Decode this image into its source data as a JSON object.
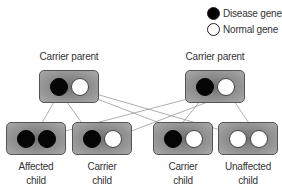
{
  "legend": {
    "disease": "Disease gene",
    "normal": "Normal gene"
  },
  "parents": [
    {
      "label": "Carrier parent",
      "alleles": [
        "disease",
        "normal"
      ]
    },
    {
      "label": "Carrier parent",
      "alleles": [
        "disease",
        "normal"
      ]
    }
  ],
  "children": [
    {
      "line1": "Affected",
      "line2": "child",
      "alleles": [
        "disease",
        "disease"
      ]
    },
    {
      "line1": "Carrier",
      "line2": "child",
      "alleles": [
        "disease",
        "normal"
      ]
    },
    {
      "line1": "Carrier",
      "line2": "child",
      "alleles": [
        "disease",
        "normal"
      ]
    },
    {
      "line1": "Unaffected",
      "line2": "child",
      "alleles": [
        "normal",
        "normal"
      ]
    }
  ],
  "inheritance": [
    {
      "from_parent": 0,
      "allele": 0,
      "to_child": 0
    },
    {
      "from_parent": 1,
      "allele": 0,
      "to_child": 0
    },
    {
      "from_parent": 0,
      "allele": 0,
      "to_child": 1
    },
    {
      "from_parent": 1,
      "allele": 1,
      "to_child": 1
    },
    {
      "from_parent": 1,
      "allele": 0,
      "to_child": 2
    },
    {
      "from_parent": 0,
      "allele": 1,
      "to_child": 2
    },
    {
      "from_parent": 0,
      "allele": 1,
      "to_child": 3
    },
    {
      "from_parent": 1,
      "allele": 1,
      "to_child": 3
    }
  ],
  "colors": {
    "disease": "#000000",
    "normal": "#ffffff",
    "box": "#8a8a8a",
    "line": "#9a9a9a"
  }
}
